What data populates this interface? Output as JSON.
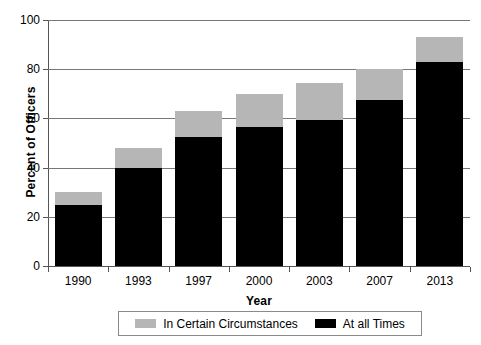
{
  "chart_data": {
    "type": "bar",
    "stacked": true,
    "title": "",
    "subtitle": "",
    "xlabel": "Year",
    "ylabel": "Percent of Officers",
    "categories": [
      "1990",
      "1993",
      "1997",
      "2000",
      "2003",
      "2007",
      "2013"
    ],
    "ylim": [
      0,
      100
    ],
    "yticks": [
      0,
      20,
      40,
      60,
      80,
      100
    ],
    "ytick_labels": [
      "0",
      "20",
      "40",
      "60",
      "80",
      "100"
    ],
    "grid": "horizontal",
    "legend_position": "bottom",
    "series": [
      {
        "name": "At all Times",
        "color": "#000000",
        "values": [
          25,
          40,
          52.5,
          56.5,
          59.5,
          67.5,
          83
        ]
      },
      {
        "name": "In Certain Circumstances",
        "color": "#b6b6b6",
        "values": [
          5,
          8,
          10.5,
          13.5,
          15,
          12.5,
          10
        ]
      }
    ],
    "totals": [
      30,
      48,
      63,
      70,
      74.5,
      80,
      93
    ]
  },
  "legend": {
    "items": [
      {
        "label": "In Certain Circumstances",
        "swatch": "gray"
      },
      {
        "label": "At all Times",
        "swatch": "black"
      }
    ]
  },
  "colors": {
    "gray": "#b6b6b6",
    "black": "#000000",
    "axis": "#555555",
    "grid": "#777777",
    "background": "#ffffff"
  }
}
